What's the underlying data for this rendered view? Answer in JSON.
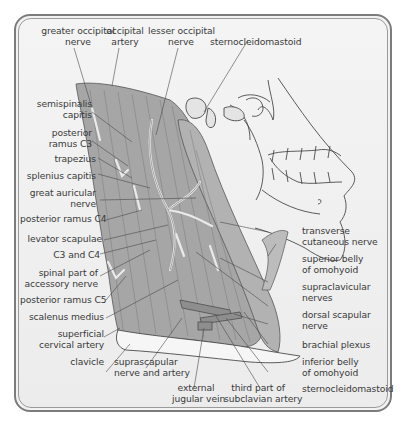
{
  "figure": {
    "colors": {
      "frame_border": "#7c7c7c",
      "background": "#f0f0f0",
      "muscle_fill": "#a6a6a6",
      "nerve_fill": "#e8e8e8",
      "line": "#4a4a4a",
      "label_text": "#3a3a3a"
    }
  },
  "labels": {
    "top": [
      {
        "id": "greater-occipital-nerve",
        "text_line1": "greater occipital",
        "text_line2": "nerve"
      },
      {
        "id": "occipital-artery",
        "text_line1": "occipital",
        "text_line2": "artery"
      },
      {
        "id": "lesser-occipital-nerve",
        "text_line1": "lesser occipital",
        "text_line2": "nerve"
      },
      {
        "id": "sternocleidomastoid-top",
        "text_line1": "sternocleidomastoid"
      }
    ],
    "left": [
      {
        "id": "semispinalis-capitis",
        "text_line1": "semispinalis",
        "text_line2": "capitis"
      },
      {
        "id": "posterior-ramus-c3",
        "text_line1": "posterior",
        "text_line2": "ramus C3"
      },
      {
        "id": "trapezius",
        "text_line1": "trapezius"
      },
      {
        "id": "splenius-capitis",
        "text_line1": "splenius capitis"
      },
      {
        "id": "great-auricular-nerve",
        "text_line1": "great auricular",
        "text_line2": "nerve"
      },
      {
        "id": "posterior-ramus-c4",
        "text_line1": "posterior ramus C4"
      },
      {
        "id": "levator-scapulae",
        "text_line1": "levator scapulae"
      },
      {
        "id": "c3-and-c4",
        "text_line1": "C3 and C4"
      },
      {
        "id": "spinal-part-accessory-nerve",
        "text_line1": "spinal part of",
        "text_line2": "accessory nerve"
      },
      {
        "id": "posterior-ramus-c5",
        "text_line1": "posterior ramus C5"
      },
      {
        "id": "scalenus-medius",
        "text_line1": "scalenus medius"
      },
      {
        "id": "superficial-cervical-artery",
        "text_line1": "superficial",
        "text_line2": "cervical artery"
      },
      {
        "id": "clavicle",
        "text_line1": "clavicle"
      }
    ],
    "bottom": [
      {
        "id": "suprascapular-nerve-artery",
        "text_line1": "suprascapular",
        "text_line2": "nerve and artery"
      },
      {
        "id": "external-jugular-vein",
        "text_line1": "external",
        "text_line2": "jugular vein"
      },
      {
        "id": "third-part-subclavian-artery",
        "text_line1": "third part of",
        "text_line2": "subclavian artery"
      }
    ],
    "right": [
      {
        "id": "transverse-cutaneous-nerve",
        "text_line1": "transverse",
        "text_line2": "cutaneous nerve"
      },
      {
        "id": "superior-belly-omohyoid",
        "text_line1": "superior belly",
        "text_line2": "of omohyoid"
      },
      {
        "id": "supraclavicular-nerves",
        "text_line1": "supraclavicular",
        "text_line2": "nerves"
      },
      {
        "id": "dorsal-scapular-nerve",
        "text_line1": "dorsal scapular",
        "text_line2": "nerve"
      },
      {
        "id": "brachial-plexus",
        "text_line1": "brachial plexus"
      },
      {
        "id": "inferior-belly-omohyoid",
        "text_line1": "inferior belly",
        "text_line2": "of omohyoid"
      },
      {
        "id": "sternocleidomastoid-bottom",
        "text_line1": "sternocleidomastoid"
      }
    ]
  }
}
